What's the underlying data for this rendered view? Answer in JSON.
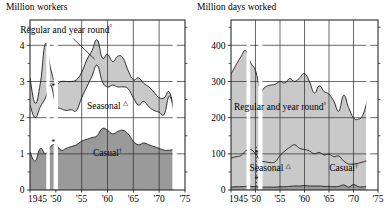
{
  "figure": {
    "kind": "two-panel stacked area chart",
    "panels": [
      "left",
      "right"
    ]
  },
  "left": {
    "title": "Million workers",
    "axis": {
      "ylabel": "",
      "xlabel": "",
      "yticks": [
        "0",
        "1",
        "2",
        "3",
        "4"
      ],
      "ytick_values": [
        0,
        1,
        2,
        3,
        4
      ],
      "yminor_values": [
        0.5,
        1.5,
        2.5,
        3.5,
        4.5
      ],
      "ylim": [
        0,
        4.7
      ],
      "xticks": [
        "1945",
        "'50",
        "'55",
        "'60",
        "'65",
        "'70",
        "'75"
      ],
      "xtick_values": [
        1945,
        1950,
        1955,
        1960,
        1965,
        1970,
        1975
      ],
      "xlim": [
        1945,
        1975
      ],
      "grid": true
    },
    "labels": {
      "regular": "Regular and year round",
      "regular_sup": "°",
      "seasonal": "Seasonal",
      "seasonal_sup": "△",
      "casual": "Casual",
      "casual_sup": "†",
      "break_marker": "*"
    }
  },
  "right": {
    "title": "Million days worked",
    "axis": {
      "yticks": [
        "0",
        "100",
        "200",
        "300",
        "400"
      ],
      "ytick_values": [
        0,
        100,
        200,
        300,
        400
      ],
      "yminor_values": [
        50,
        150,
        250,
        350,
        450
      ],
      "ylim": [
        0,
        470
      ],
      "xticks": [
        "1945",
        "'50",
        "'55",
        "'60",
        "'65",
        "'70",
        "'75"
      ],
      "xtick_values": [
        1945,
        1950,
        1955,
        1960,
        1965,
        1970,
        1975
      ],
      "xlim": [
        1945,
        1975
      ],
      "grid": true
    },
    "labels": {
      "regular": "Regular and year round",
      "regular_sup": "°",
      "seasonal": "Seasonal",
      "seasonal_sup": "△",
      "casual": "Casual",
      "casual_sup": "†",
      "break_marker": "*"
    }
  },
  "colors": {
    "line": "#1a1a1a",
    "band_light": "#c9c9c9",
    "band_dark": "#9a9a9a",
    "grid": "#2b2b2b",
    "background": "#ffffff",
    "gap": "#ffffff"
  },
  "chart_data": {
    "type": "area",
    "panels": [
      {
        "name": "Million workers",
        "title": "Million workers",
        "type": "area",
        "xlabel": "",
        "ylabel": "Million workers",
        "xlim": [
          1945,
          1975
        ],
        "ylim": [
          0,
          4.7
        ],
        "grid": true,
        "legend_position": "inline-annotations",
        "x": [
          1945,
          1946,
          1947,
          1948,
          1949,
          1950,
          1951,
          1952,
          1953,
          1954,
          1955,
          1956,
          1957,
          1958,
          1959,
          1960,
          1961,
          1962,
          1963,
          1964,
          1965,
          1966,
          1967,
          1968,
          1969,
          1970,
          1971,
          1972,
          1973
        ],
        "series": [
          {
            "name": "Casual",
            "note": "Casual† — lowest band, filled dark grey from 0",
            "values": [
              1.05,
              0.8,
              1.15,
              1.0,
              1.2,
              1.25,
              1.1,
              1.15,
              1.2,
              1.25,
              1.35,
              1.4,
              1.45,
              1.5,
              1.7,
              1.65,
              1.55,
              1.62,
              1.65,
              1.55,
              1.35,
              1.25,
              1.3,
              1.25,
              1.2,
              1.15,
              1.1,
              1.1,
              1.12
            ]
          },
          {
            "name": "Seasonal",
            "note": "Seasonal △ — lower edge of the upper light band",
            "values": [
              2.35,
              2.0,
              2.3,
              2.55,
              2.9,
              2.35,
              2.25,
              2.2,
              2.22,
              2.2,
              2.55,
              2.85,
              3.15,
              3.45,
              3.0,
              2.85,
              2.9,
              2.85,
              2.85,
              2.8,
              2.55,
              2.35,
              2.45,
              2.3,
              2.2,
              2.15,
              2.1,
              2.6,
              2.05
            ]
          },
          {
            "name": "Regular and year round",
            "note": "Regular and year round° — upper edge of the upper light band",
            "values": [
              3.1,
              2.4,
              2.95,
              4.05,
              3.35,
              2.95,
              3.0,
              3.0,
              3.0,
              3.05,
              3.25,
              3.6,
              3.85,
              4.15,
              3.65,
              3.75,
              3.55,
              3.7,
              3.65,
              3.3,
              3.05,
              3.1,
              2.95,
              2.85,
              2.7,
              2.55,
              2.55,
              2.7,
              2.1
            ]
          }
        ],
        "annotations": [
          {
            "text": "Regular and year round°",
            "x": 1952,
            "y": 4.35
          },
          {
            "text": "Seasonal △",
            "x": 1960,
            "y": 2.25
          },
          {
            "text": "Casual†",
            "x": 1960,
            "y": 0.95
          },
          {
            "text": "*",
            "x": 1949.5,
            "y": 2.8
          },
          {
            "text": "*",
            "x": 1949.5,
            "y": 1.25
          }
        ],
        "data_gaps": [
          [
            1948.2,
            1948.8
          ],
          [
            1949.6,
            1950.4
          ],
          [
            1972.6,
            1973.4
          ]
        ]
      },
      {
        "name": "Million days worked",
        "title": "Million days worked",
        "type": "area",
        "xlabel": "",
        "ylabel": "Million days worked",
        "xlim": [
          1945,
          1975
        ],
        "ylim": [
          0,
          470
        ],
        "grid": true,
        "legend_position": "inline-annotations",
        "x": [
          1945,
          1946,
          1947,
          1948,
          1949,
          1950,
          1951,
          1952,
          1953,
          1954,
          1955,
          1956,
          1957,
          1958,
          1959,
          1960,
          1961,
          1962,
          1963,
          1964,
          1965,
          1966,
          1967,
          1968,
          1969,
          1970,
          1971,
          1972,
          1973
        ],
        "series": [
          {
            "name": "Casual",
            "note": "Casual† — thin dark band just above zero",
            "values": [
              8,
              9,
              9,
              10,
              10,
              9,
              8,
              8,
              8,
              8,
              9,
              9,
              10,
              11,
              11,
              12,
              11,
              11,
              11,
              10,
              10,
              9,
              10,
              14,
              8,
              15,
              9,
              9,
              10
            ]
          },
          {
            "name": "Seasonal",
            "note": "Seasonal △ — upper edge of lower light band",
            "values": [
              88,
              92,
              95,
              108,
              112,
              100,
              82,
              78,
              76,
              78,
              95,
              108,
              118,
              125,
              115,
              112,
              108,
              100,
              104,
              97,
              99,
              92,
              94,
              80,
              72,
              72,
              74,
              78,
              82
            ]
          },
          {
            "name": "Regular and year round",
            "note": "Regular and year round° — upper edge of upper light band",
            "values": [
              320,
              345,
              368,
              385,
              352,
              330,
              278,
              285,
              290,
              292,
              300,
              296,
              308,
              300,
              310,
              322,
              300,
              268,
              288,
              272,
              265,
              245,
              218,
              262,
              228,
              200,
              196,
              210,
              258
            ]
          }
        ],
        "annotations": [
          {
            "text": "Regular and year round°",
            "x": 1955,
            "y": 222
          },
          {
            "text": "Seasonal △",
            "x": 1953,
            "y": 52
          },
          {
            "text": "Casual†",
            "x": 1968,
            "y": 52
          },
          {
            "text": "*",
            "x": 1950.2,
            "y": 95
          },
          {
            "text": "*",
            "x": 1950.2,
            "y": 22
          }
        ],
        "data_gaps": [
          [
            1948.2,
            1948.9
          ],
          [
            1950.6,
            1951.4
          ],
          [
            1972.6,
            1973.4
          ]
        ]
      }
    ]
  }
}
